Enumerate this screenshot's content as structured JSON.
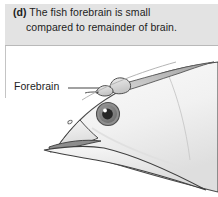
{
  "panel": {
    "letter": "(d)",
    "caption_line_1": "The fish forebrain is small",
    "caption_line_2": "compared to remainder of brain.",
    "caption_full": "(d) The fish forebrain is small compared to remainder of brain."
  },
  "labels": {
    "forebrain": "Forebrain"
  },
  "diagram": {
    "structures": [
      "forebrain",
      "midbrain lobe",
      "hindbrain",
      "eye",
      "upper jaw",
      "lower jaw",
      "nostril",
      "gill cover margin"
    ],
    "leader_line": {
      "from_label": "Forebrain",
      "points_to": "forebrain lobe"
    }
  },
  "colors": {
    "caption_background": "#e3e3e3",
    "caption_rule": "#b9b9b9",
    "text": "#1d1d1d",
    "page_background": "#ffffff",
    "body_fill_light": "#f4f4f4",
    "body_fill_mid": "#e6e6e6",
    "outline": "#3b3b3b",
    "eye_iris": "#7c7c7c",
    "eye_pupil": "#2b2b2b",
    "eye_highlight": "#ffffff",
    "brain_fill": "#d8d8d8",
    "leader_line": "#555555"
  }
}
